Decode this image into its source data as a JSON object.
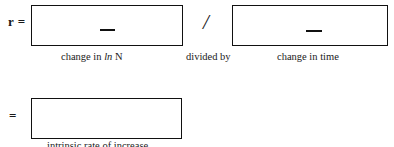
{
  "worksheet": {
    "equation_line_1": {
      "lhs": "r =",
      "numerator": {
        "placeholder_mark": "—",
        "caption_prefix": "change in ",
        "caption_italic": "ln",
        "caption_suffix": " N"
      },
      "operator": "/",
      "operator_caption": "divided by",
      "denominator": {
        "placeholder_mark": "—",
        "caption": "change in time"
      }
    },
    "equation_line_2": {
      "lhs": "=",
      "result": {
        "value": "",
        "caption": "intrinsic rate of increase"
      }
    }
  },
  "colors": {
    "ink": "#111111",
    "page": "#ffffff"
  }
}
